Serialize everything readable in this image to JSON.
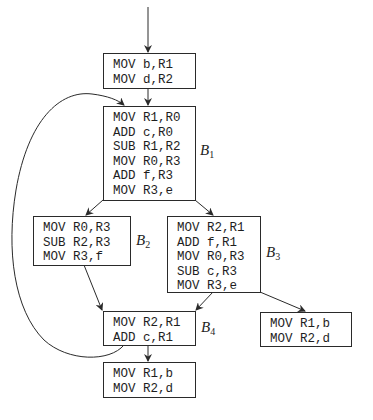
{
  "diagram": {
    "type": "control-flow-graph",
    "blocks": {
      "entry": {
        "label": "",
        "instructions": [
          "MOV b,R1",
          "MOV d,R2"
        ]
      },
      "b1": {
        "label_letter": "B",
        "label_sub": "1",
        "instructions": [
          "MOV R1,R0",
          "ADD c,R0",
          "SUB R1,R2",
          "MOV R0,R3",
          "ADD f,R3",
          "MOV R3,e"
        ]
      },
      "b2": {
        "label_letter": "B",
        "label_sub": "2",
        "instructions": [
          "MOV R0,R3",
          "SUB R2,R3",
          "MOV R3,f"
        ]
      },
      "b3": {
        "label_letter": "B",
        "label_sub": "3",
        "instructions": [
          "MOV R2,R1",
          "ADD f,R1",
          "MOV R0,R3",
          "SUB c,R3",
          "MOV R3,e"
        ]
      },
      "b4": {
        "label_letter": "B",
        "label_sub": "4",
        "instructions": [
          "MOV R2,R1",
          "ADD c,R1"
        ]
      },
      "exit_b4": {
        "label": "",
        "instructions": [
          "MOV R1,b",
          "MOV R2,d"
        ]
      },
      "exit_b3": {
        "label": "",
        "instructions": [
          "MOV R1,b",
          "MOV R2,d"
        ]
      }
    },
    "edges": [
      {
        "from": "start",
        "to": "entry"
      },
      {
        "from": "entry",
        "to": "b1"
      },
      {
        "from": "b1",
        "to": "b2"
      },
      {
        "from": "b1",
        "to": "b3"
      },
      {
        "from": "b2",
        "to": "b4"
      },
      {
        "from": "b3",
        "to": "b4"
      },
      {
        "from": "b3",
        "to": "exit_b3"
      },
      {
        "from": "b4",
        "to": "exit_b4"
      },
      {
        "from": "b4",
        "to": "b1",
        "kind": "back-edge"
      }
    ],
    "colors": {
      "stroke": "#2a2a2a",
      "text": "#1e1e1e",
      "background": "#ffffff"
    }
  }
}
